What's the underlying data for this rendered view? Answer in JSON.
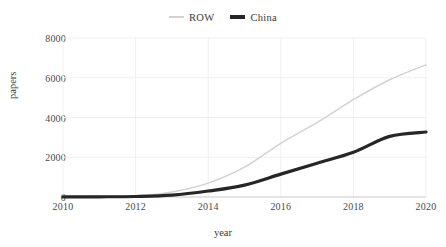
{
  "chart_data": {
    "type": "line",
    "title": "",
    "xlabel": "year",
    "ylabel": "papers",
    "xlim": [
      2010,
      2020
    ],
    "ylim": [
      0,
      8000
    ],
    "xticks": [
      2010,
      2012,
      2014,
      2016,
      2018,
      2020
    ],
    "yticks": [
      0,
      2000,
      4000,
      6000,
      8000
    ],
    "xtick_labels": [
      "2010",
      "2012",
      "2014",
      "2016",
      "2018",
      "2020"
    ],
    "ytick_labels": [
      "0",
      "2000",
      "4000",
      "6000",
      "8000"
    ],
    "grid": true,
    "legend_position": "top-center",
    "x": [
      2010,
      2011,
      2012,
      2013,
      2014,
      2015,
      2016,
      2017,
      2018,
      2019,
      2020
    ],
    "series": [
      {
        "name": "ROW",
        "color": "#d2d2d2",
        "line_width": 1.5,
        "values": [
          20,
          35,
          60,
          250,
          700,
          1500,
          2700,
          3750,
          4900,
          5900,
          6650
        ]
      },
      {
        "name": "China",
        "color": "#262626",
        "line_width": 3.2,
        "values": [
          5,
          10,
          25,
          90,
          300,
          600,
          1150,
          1700,
          2250,
          3050,
          3270
        ]
      }
    ]
  },
  "legend": {
    "entries": [
      {
        "label": "ROW",
        "icon": "line-swatch-icon"
      },
      {
        "label": "China",
        "icon": "line-swatch-icon"
      }
    ]
  },
  "colors": {
    "background": "#ffffff",
    "grid": "#f0f0f0",
    "axis": "#c8c8c8",
    "text": "#3a3a3a",
    "series_row": "#d2d2d2",
    "series_china": "#262626"
  }
}
